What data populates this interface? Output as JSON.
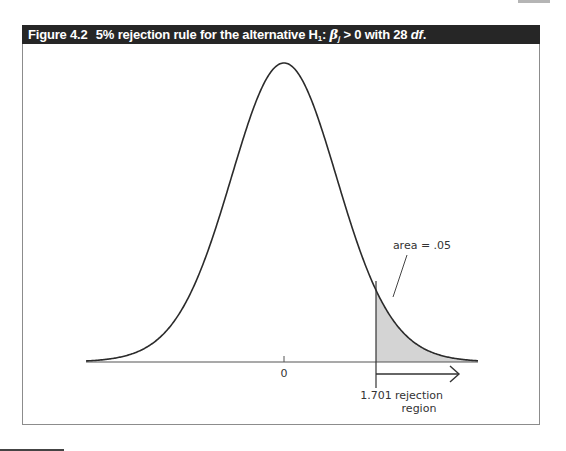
{
  "figure": {
    "number": "Figure 4.2",
    "title_prefix": "5% rejection rule for the alternative H",
    "title_sub": "1",
    "title_colon": ": ",
    "title_beta": "β",
    "title_beta_sub": "j",
    "title_relation": " > 0 with 28 ",
    "title_df": "df",
    "title_end": "."
  },
  "labels": {
    "zero": "0",
    "critical_value": "1.701",
    "area": "area = .05",
    "rejection_line1": "rejection",
    "rejection_line2": "region"
  },
  "colors": {
    "title_bg": "#262626",
    "curve": "#2b2b2b",
    "shade": "#d4d4d4",
    "axis": "#555555"
  },
  "chart_data": {
    "type": "area",
    "title": "Figure 4.2 5% rejection rule for the alternative H1: βj > 0 with 28 df.",
    "distribution": "t",
    "degrees_of_freedom": 28,
    "alpha": 0.05,
    "tail": "right",
    "critical_value": 1.701,
    "x_ticks": [
      0
    ],
    "x_tick_labels": [
      "0"
    ],
    "annotations": [
      {
        "text": "area = .05",
        "points_to": "shaded right tail"
      },
      {
        "text": "1.701",
        "position": "critical value on x-axis"
      },
      {
        "text": "rejection region",
        "position": "arrow to the right of 1.701"
      }
    ],
    "shaded_region": {
      "from": 1.701,
      "to": "inf"
    },
    "xlabel": "",
    "ylabel": "",
    "grid": false,
    "legend": "none"
  }
}
